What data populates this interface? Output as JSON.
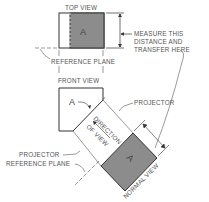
{
  "labels": {
    "top_view": "TOP VIEW",
    "front_view": "FRONT VIEW",
    "reference_plane_upper": "REFERENCE PLANE",
    "reference_plane_lower": "REFERENCE PLANE",
    "measure_line1": "MEASURE THIS",
    "measure_line2": "DISTANCE AND",
    "measure_line3": "TRANSFER HERE",
    "projector_upper": "PROJECTOR",
    "projector_lower": "PROJECTOR",
    "direction_line1": "DIRECTION",
    "direction_line2": "OF VIEW",
    "normal_view": "NORMAL VIEW",
    "surface_top": "A",
    "surface_front": "A",
    "surface_normal": "A"
  },
  "colors": {
    "line": "#333333",
    "fill_gray": "#8c8c8c",
    "text": "#555555"
  }
}
